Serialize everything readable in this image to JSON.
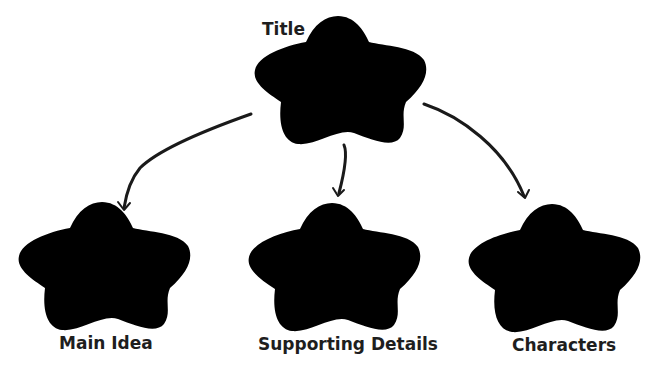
{
  "diagram": {
    "type": "graphic-organizer",
    "nodes": [
      {
        "id": "title",
        "label": "Title",
        "shape": "flower-cloud",
        "x": 254,
        "y": 16,
        "w": 174,
        "h": 132,
        "label_x": 262,
        "label_y": 20
      },
      {
        "id": "main-idea",
        "label": "Main Idea",
        "shape": "flower-cloud",
        "x": 18,
        "y": 202,
        "w": 174,
        "h": 132,
        "label_x": 59,
        "label_y": 334
      },
      {
        "id": "supporting-details",
        "label": "Supporting Details",
        "shape": "flower-cloud",
        "x": 248,
        "y": 203,
        "w": 174,
        "h": 132,
        "label_x": 258,
        "label_y": 335
      },
      {
        "id": "characters",
        "label": "Characters",
        "shape": "flower-cloud",
        "x": 468,
        "y": 204,
        "w": 174,
        "h": 132,
        "label_x": 512,
        "label_y": 336
      }
    ],
    "edges": [
      {
        "from": "title",
        "to": "main-idea"
      },
      {
        "from": "title",
        "to": "supporting-details"
      },
      {
        "from": "title",
        "to": "characters"
      }
    ],
    "colors": {
      "outline": "#8a8a8a",
      "arrow": "#1a1a1a",
      "text": "#1e1e1e",
      "background": "#ffffff"
    }
  }
}
